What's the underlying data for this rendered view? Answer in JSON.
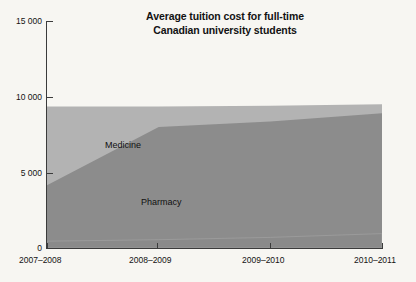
{
  "title": {
    "line1": "Average tuition cost for full-time",
    "line2": "Canadian university students"
  },
  "axes": {
    "y_ticks": [
      "15 000",
      "10 000",
      "5 000",
      "0"
    ],
    "y_tick_values": [
      15000,
      10000,
      5000,
      0
    ],
    "x_ticks": [
      "2007–2008",
      "2008–2009",
      "2009–2010",
      "2010–2011"
    ]
  },
  "series_labels": {
    "medicine": "Medicine",
    "pharmacy": "Pharmacy"
  },
  "colors": {
    "background": "#f7f6f2",
    "medicine_area": "#b3b3b3",
    "pharmacy_area": "#8c8c8c",
    "third_area": "#8a8a8a",
    "axis": "#3b3b3b",
    "text": "#121212"
  },
  "chart_data": {
    "type": "area",
    "title": "Average tuition cost for full-time Canadian university students",
    "xlabel": "",
    "ylabel": "",
    "categories": [
      "2007–2008",
      "2008–2009",
      "2009–2010",
      "2010–2011"
    ],
    "ylim": [
      0,
      15000
    ],
    "yticks": [
      0,
      5000,
      10000,
      15000
    ],
    "grid": false,
    "legend": "in-plot area labels",
    "stacked": false,
    "series": [
      {
        "name": "Medicine",
        "values": [
          9350,
          9350,
          9400,
          9500
        ]
      },
      {
        "name": "Pharmacy",
        "values": [
          4150,
          8000,
          8350,
          8900
        ]
      },
      {
        "name": "Other",
        "values": [
          450,
          550,
          700,
          950
        ]
      }
    ]
  }
}
